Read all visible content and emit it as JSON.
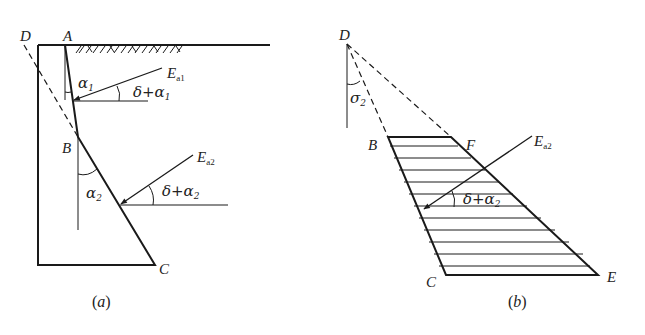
{
  "figure_a": {
    "caption_open": "(",
    "caption_letter": "a",
    "caption_close": ")",
    "points": {
      "D": "D",
      "A": "A",
      "B": "B",
      "C": "C"
    },
    "angles": {
      "alpha1": "α",
      "alpha1_sub": "1",
      "alpha2": "α",
      "alpha2_sub": "2",
      "delta_alpha1": "δ+α",
      "delta_alpha1_sub": "1",
      "delta_alpha2": "δ+α",
      "delta_alpha2_sub": "2"
    },
    "forces": {
      "Ea1": "E",
      "Ea1_sub": "a1",
      "Ea2": "E",
      "Ea2_sub": "a2"
    }
  },
  "figure_b": {
    "caption_open": "(",
    "caption_letter": "b",
    "caption_close": ")",
    "points": {
      "D": "D",
      "B": "B",
      "F": "F",
      "C": "C",
      "E": "E"
    },
    "angles": {
      "sigma2": "σ",
      "sigma2_sub": "2",
      "delta_alpha2": "δ+α",
      "delta_alpha2_sub": "2"
    },
    "forces": {
      "Ea2": "E",
      "Ea2_sub": "a2"
    }
  },
  "colors": {
    "line": "#1a1a1a",
    "background": "#ffffff"
  }
}
